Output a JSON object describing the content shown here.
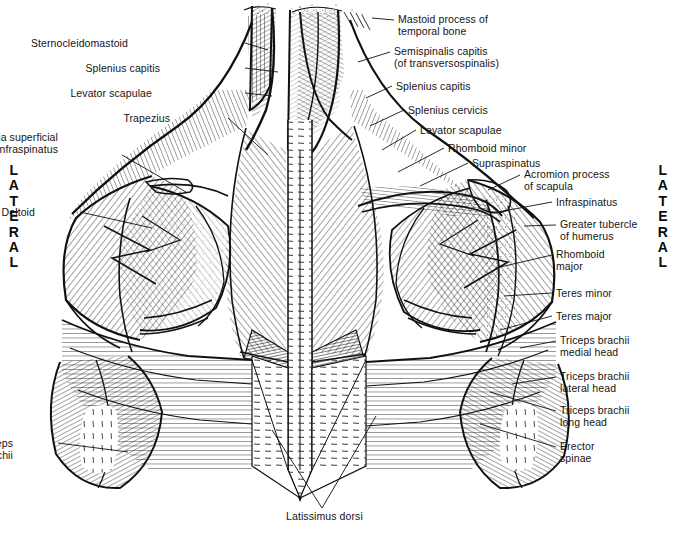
{
  "figure": {
    "background": "#ffffff",
    "ink": "#141414"
  },
  "orientation": {
    "left_label": "LATERAL",
    "right_label": "LATERAL",
    "left_letters": [
      "L",
      "A",
      "T",
      "E",
      "R",
      "A",
      "L"
    ],
    "right_letters": [
      "L",
      "A",
      "T",
      "E",
      "R",
      "A",
      "L"
    ]
  },
  "labels_left": [
    {
      "id": "sternocleidomastoid",
      "text": "Sternocleidomastoid",
      "x": 128,
      "y": 37,
      "lx": 245,
      "ly": 43,
      "tx": 268,
      "ty": 50
    },
    {
      "id": "splenius-capitis-left",
      "text": "Splenius capitis",
      "x": 160,
      "y": 62,
      "lx": 245,
      "ly": 68,
      "tx": 278,
      "ty": 72
    },
    {
      "id": "levator-scapulae-left",
      "text": "Levator scapulae",
      "x": 152,
      "y": 87,
      "lx": 245,
      "ly": 93,
      "tx": 272,
      "ty": 96
    },
    {
      "id": "trapezius",
      "text": "Trapezius",
      "x": 170,
      "y": 112,
      "lx": 228,
      "ly": 118,
      "tx": 268,
      "ty": 155
    },
    {
      "id": "fascia-infraspinatus",
      "text": "Fascia superficial\nto the infraspinatus",
      "x": 58,
      "y": 131,
      "lx": 122,
      "ly": 155,
      "tx": 186,
      "ty": 192
    },
    {
      "id": "deltoid",
      "text": "Deltoid",
      "x": 35,
      "y": 206,
      "lx": 80,
      "ly": 212,
      "tx": 152,
      "ty": 228
    },
    {
      "id": "triceps-brachii-left",
      "text": "Triceps\nbrachii",
      "x": 13,
      "y": 437,
      "lx": 58,
      "ly": 443,
      "tx": 128,
      "ty": 452
    }
  ],
  "labels_right": [
    {
      "id": "mastoid-process",
      "text": "Mastoid process of\ntemporal bone",
      "x": 398,
      "y": 13,
      "lx": 394,
      "ly": 20,
      "tx": 372,
      "ty": 18
    },
    {
      "id": "semispinalis-capitis",
      "text": "Semispinalis capitis\n(of transversospinalis)",
      "x": 394,
      "y": 45,
      "lx": 390,
      "ly": 52,
      "tx": 358,
      "ty": 62
    },
    {
      "id": "splenius-capitis-right",
      "text": "Splenius capitis",
      "x": 396,
      "y": 80,
      "lx": 392,
      "ly": 86,
      "tx": 366,
      "ty": 98
    },
    {
      "id": "splenius-cervicis",
      "text": "Splenius cervicis",
      "x": 408,
      "y": 104,
      "lx": 404,
      "ly": 110,
      "tx": 370,
      "ty": 126
    },
    {
      "id": "levator-scapulae-right",
      "text": "Levator scapulae",
      "x": 420,
      "y": 124,
      "lx": 416,
      "ly": 130,
      "tx": 382,
      "ty": 150
    },
    {
      "id": "rhomboid-minor",
      "text": "Rhomboid minor",
      "x": 448,
      "y": 142,
      "lx": 444,
      "ly": 148,
      "tx": 398,
      "ty": 172
    },
    {
      "id": "supraspinatus",
      "text": "Supraspinatus",
      "x": 472,
      "y": 157,
      "lx": 468,
      "ly": 163,
      "tx": 420,
      "ty": 186
    },
    {
      "id": "acromion-process",
      "text": "Acromion process\nof scapula",
      "x": 524,
      "y": 168,
      "lx": 520,
      "ly": 175,
      "tx": 488,
      "ty": 190
    },
    {
      "id": "infraspinatus",
      "text": "Infraspinatus",
      "x": 556,
      "y": 196,
      "lx": 552,
      "ly": 202,
      "tx": 498,
      "ty": 212
    },
    {
      "id": "greater-tubercle",
      "text": "Greater tubercle\nof humerus",
      "x": 560,
      "y": 218,
      "lx": 556,
      "ly": 225,
      "tx": 524,
      "ty": 226
    },
    {
      "id": "rhomboid-major",
      "text": "Rhomboid\nmajor",
      "x": 556,
      "y": 248,
      "lx": 552,
      "ly": 255,
      "tx": 496,
      "ty": 268
    },
    {
      "id": "teres-minor",
      "text": "Teres minor",
      "x": 556,
      "y": 287,
      "lx": 552,
      "ly": 293,
      "tx": 504,
      "ty": 296
    },
    {
      "id": "teres-major",
      "text": "Teres major",
      "x": 556,
      "y": 310,
      "lx": 552,
      "ly": 316,
      "tx": 500,
      "ty": 330
    },
    {
      "id": "triceps-medial-head",
      "text": "Triceps brachii\nmedial head",
      "x": 560,
      "y": 334,
      "lx": 556,
      "ly": 341,
      "tx": 520,
      "ty": 348
    },
    {
      "id": "triceps-lateral-head",
      "text": "Triceps brachii\nlateral head",
      "x": 560,
      "y": 370,
      "lx": 556,
      "ly": 377,
      "tx": 512,
      "ty": 384
    },
    {
      "id": "triceps-long-head",
      "text": "Triceps brachii\nlong head",
      "x": 560,
      "y": 404,
      "lx": 556,
      "ly": 411,
      "tx": 490,
      "ty": 392
    },
    {
      "id": "erector-spinae",
      "text": "Erector\nspinae",
      "x": 560,
      "y": 440,
      "lx": 556,
      "ly": 447,
      "tx": 480,
      "ty": 424
    }
  ],
  "labels_bottom": [
    {
      "id": "latissimus-dorsi",
      "text": "Latissimus dorsi",
      "x": 286,
      "y": 510,
      "lx": 322,
      "ly": 508,
      "ax": 272,
      "ay": 430,
      "bx": 376,
      "by": 416
    }
  ]
}
